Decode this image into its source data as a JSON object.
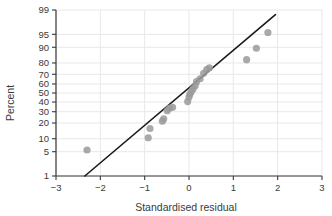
{
  "chart_data": {
    "type": "scatter",
    "title": "",
    "subtitle": "",
    "xlabel": "Standardised residual",
    "ylabel": "Percent",
    "xlim": [
      -3,
      3
    ],
    "ylim": [
      1,
      99
    ],
    "y_scale": "normal-probability",
    "grid": true,
    "legend": null,
    "x_ticks": [
      -3,
      -2,
      -1,
      0,
      1,
      2,
      3
    ],
    "x_tick_labels": [
      "−3",
      "−2",
      "−1",
      "0",
      "1",
      "2",
      "3"
    ],
    "y_ticks": [
      1,
      5,
      10,
      20,
      30,
      40,
      50,
      60,
      70,
      80,
      90,
      95,
      99
    ],
    "y_tick_labels": [
      "1",
      "5",
      "10",
      "20",
      "30",
      "40",
      "50",
      "60",
      "70",
      "80",
      "90",
      "95",
      "99"
    ],
    "marker": {
      "shape": "circle",
      "color": "#9a9a9a",
      "size": 5
    },
    "reference_line": {
      "color": "#1a1a1a",
      "width": 1.6,
      "x_start": -2.35,
      "y_start": 1.0,
      "x_end": 1.95,
      "y_end": 98.6
    },
    "points": [
      {
        "x": -2.3,
        "y": 5.5
      },
      {
        "x": -0.92,
        "y": 10.5
      },
      {
        "x": -0.88,
        "y": 16.0
      },
      {
        "x": -0.6,
        "y": 21.5
      },
      {
        "x": -0.57,
        "y": 23.5
      },
      {
        "x": -0.49,
        "y": 31.0
      },
      {
        "x": -0.44,
        "y": 33.5
      },
      {
        "x": -0.37,
        "y": 34.5
      },
      {
        "x": -0.03,
        "y": 40.5
      },
      {
        "x": 0.0,
        "y": 45.5
      },
      {
        "x": 0.02,
        "y": 48.5
      },
      {
        "x": 0.05,
        "y": 51.5
      },
      {
        "x": 0.09,
        "y": 54.5
      },
      {
        "x": 0.14,
        "y": 58.0
      },
      {
        "x": 0.17,
        "y": 62.5
      },
      {
        "x": 0.25,
        "y": 65.5
      },
      {
        "x": 0.33,
        "y": 71.0
      },
      {
        "x": 0.4,
        "y": 74.5
      },
      {
        "x": 0.46,
        "y": 76.0
      },
      {
        "x": 1.3,
        "y": 82.5
      },
      {
        "x": 1.52,
        "y": 89.5
      },
      {
        "x": 1.78,
        "y": 95.5
      }
    ]
  },
  "colors": {
    "marker": "#9a9a9a",
    "line": "#1a1a1a",
    "axis": "#3a3a3a",
    "grid": "#e8e8ea",
    "background": "#ffffff"
  }
}
